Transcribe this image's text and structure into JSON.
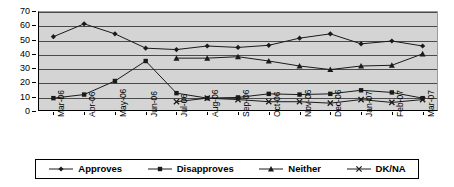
{
  "chart_data": {
    "type": "line",
    "title": "",
    "subtitle": "",
    "xlabel": "",
    "ylabel": "",
    "ylim": [
      0,
      70
    ],
    "yticks": [
      0,
      10,
      20,
      30,
      40,
      50,
      60,
      70
    ],
    "grid": true,
    "legend_position": "bottom",
    "categories": [
      "Mar-06",
      "Apr-06",
      "May-06",
      "Jun-06",
      "Jul-06",
      "Aug-06",
      "Sep-06",
      "Oct-06",
      "Nov-06",
      "Dec-06",
      "Jan-07",
      "Feb-07",
      "Mar-07"
    ],
    "series": [
      {
        "name": "Approves",
        "marker": "diamond",
        "values": [
          52,
          61,
          54,
          44,
          43,
          45.5,
          44.5,
          46,
          51,
          54,
          47,
          49,
          45.5
        ]
      },
      {
        "name": "Disapproves",
        "marker": "square",
        "values": [
          9,
          11.5,
          21,
          35,
          12.5,
          9,
          9.5,
          12,
          11.5,
          12,
          14.5,
          13,
          9
        ]
      },
      {
        "name": "Neither",
        "marker": "triangle",
        "values": [
          null,
          null,
          null,
          null,
          37,
          37,
          38,
          35,
          31.5,
          29,
          31.5,
          32,
          40
        ]
      },
      {
        "name": "DK/NA",
        "marker": "x",
        "values": [
          null,
          null,
          null,
          null,
          6.5,
          9,
          8,
          6.5,
          6.5,
          5.5,
          8,
          6,
          8
        ]
      }
    ]
  },
  "legend": {
    "items": [
      {
        "label": "Approves",
        "marker": "diamond"
      },
      {
        "label": "Disapproves",
        "marker": "square"
      },
      {
        "label": "Neither",
        "marker": "triangle"
      },
      {
        "label": "DK/NA",
        "marker": "x"
      }
    ]
  },
  "colors": {
    "plot_background": "#d4d4d4",
    "gridline": "#4a4a4a",
    "series_line": "#1a1a1a",
    "axis": "#000000",
    "page_background": "#ffffff"
  }
}
